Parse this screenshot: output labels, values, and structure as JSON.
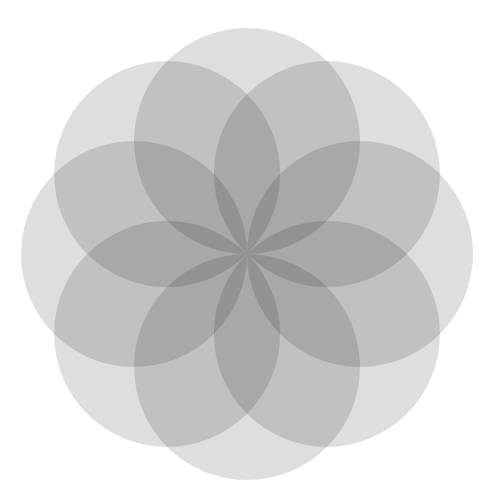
{
  "diagram": {
    "type": "overlapping-circles-rosette",
    "canvas": {
      "width": 492,
      "height": 504,
      "background": "#ffffff"
    },
    "center": {
      "x": 247,
      "y": 254
    },
    "circle_count": 8,
    "circle_radius": 113,
    "center_offset": 113,
    "start_angle_deg": -90,
    "angle_step_deg": 45,
    "fill_color": "#5a5a5a",
    "fill_opacity": 0.2,
    "observed_tones": {
      "single_overlap": "#dcdcdc",
      "double_overlap": "#9c9c9c",
      "triple_overlap": "#7a7a7a",
      "center_core": "#555555"
    }
  }
}
